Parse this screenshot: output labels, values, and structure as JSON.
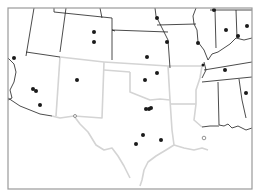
{
  "map": {
    "frame": {
      "x": 8,
      "y": 8,
      "w": 244,
      "h": 181,
      "stroke": "#9a9a9a"
    },
    "colors": {
      "background": "#ffffff",
      "dark_border": "#1e1e1e",
      "light_border": "#d4d4d4",
      "marker": "#1a1a1a",
      "marker_hollow": "#7a7a7a"
    },
    "dark_borders": [
      {
        "name": "nevada-utah",
        "d": "M34,8 L26,56"
      },
      {
        "name": "utah-east",
        "d": "M66,8 L60,52"
      },
      {
        "name": "utah-arizona",
        "d": "M26,52 L60,57"
      },
      {
        "name": "wyoming-colorado",
        "d": "M54,12 L112,18"
      },
      {
        "name": "wyoming-north",
        "d": "M54,8 L54,12"
      },
      {
        "name": "nebraska-top",
        "d": "M100,8 L102,18"
      },
      {
        "name": "colorado-east",
        "d": "M112,18 L112,60"
      },
      {
        "name": "colorado-kansas",
        "d": "M112,30 L168,32"
      },
      {
        "name": "nebraska-kansas",
        "d": "M112,30 L115,31"
      },
      {
        "name": "kansas-missouri",
        "d": "M164,32 L168,40 L170,68"
      },
      {
        "name": "nebraska-iowa",
        "d": "M155,8 L156,16 L160,24 L164,32"
      },
      {
        "name": "iowa-missouri",
        "d": "M157,25 L196,24"
      },
      {
        "name": "iowa-illinois",
        "d": "M196,8 L193,16 L194,24 L197,30 L198,42 L204,50 L208,60"
      },
      {
        "name": "illinois-indiana",
        "d": "M215,10 L216,48"
      },
      {
        "name": "indiana-ohio",
        "d": "M236,10 L237,38"
      },
      {
        "name": "ohio-river",
        "d": "M208,60 L212,54 L218,52 L224,48 L230,44 L236,38 L244,40 L252,38"
      },
      {
        "name": "illinois-top",
        "d": "M210,10 L252,10"
      },
      {
        "name": "kentucky-tennessee",
        "d": "M204,70 L252,62"
      },
      {
        "name": "missouri-tennessee",
        "d": "M204,62 L206,70 L202,78"
      },
      {
        "name": "tennessee-south",
        "d": "M202,82 L252,77"
      },
      {
        "name": "mississippi-alabama",
        "d": "M218,82 L219,125"
      },
      {
        "name": "alabama-georgia",
        "d": "M239,79 L242,100 L246,118"
      },
      {
        "name": "gulf-coast-east",
        "d": "M219,125 L224,126 L228,124 L232,128 L238,126 L246,130 L252,128"
      },
      {
        "name": "ms-coast",
        "d": "M202,127 L210,126 L219,126"
      },
      {
        "name": "california-nevada",
        "d": "M8,58 L14,64 L16,72"
      },
      {
        "name": "california-arizona",
        "d": "M16,72 L14,82 L10,90 L12,98 L8,100"
      },
      {
        "name": "arizona-mexico",
        "d": "M8,98 L20,106 L40,114 L52,116"
      }
    ],
    "light_borders": [
      {
        "name": "arizona-newmexico",
        "d": "M60,57 L56,116"
      },
      {
        "name": "colorado-newmexico",
        "d": "M60,57 L104,62"
      },
      {
        "name": "newmexico-oklahoma-panhandle",
        "d": "M104,62 L168,66"
      },
      {
        "name": "newmexico-texas",
        "d": "M104,62 L102,118 L74,116"
      },
      {
        "name": "newmexico-mexico",
        "d": "M52,116 L60,118 L74,116"
      },
      {
        "name": "oklahoma-panhandle-south",
        "d": "M104,70 L130,72"
      },
      {
        "name": "oklahoma-texas",
        "d": "M130,72 L130,92 L140,96 L150,100 L160,99 L170,100"
      },
      {
        "name": "oklahoma-arkansas",
        "d": "M168,66 L170,100"
      },
      {
        "name": "arkansas-north",
        "d": "M168,66 L202,66"
      },
      {
        "name": "arkansas-east",
        "d": "M202,66 L200,78 L196,90 L196,104"
      },
      {
        "name": "arkansas-south",
        "d": "M170,104 L196,104"
      },
      {
        "name": "texas-louisiana",
        "d": "M170,100 L172,130 L174,145"
      },
      {
        "name": "louisiana-mississippi",
        "d": "M196,104 L194,120 L202,127"
      },
      {
        "name": "louisiana-coast",
        "d": "M174,145 L184,148 L194,150 L202,148 L208,150"
      },
      {
        "name": "rio-grande",
        "d": "M74,116 L80,124 L88,132 L96,145 L104,150 L112,148 L118,156 L124,166 L130,178"
      },
      {
        "name": "texas-coast",
        "d": "M174,145 L166,150 L156,156 L148,162 L144,170 L142,180 L140,186"
      }
    ],
    "markers": [
      {
        "name": "marker-nevada",
        "cx": 14,
        "cy": 58,
        "r": 2
      },
      {
        "name": "marker-phoenix-1",
        "cx": 33,
        "cy": 89,
        "r": 2
      },
      {
        "name": "marker-phoenix-2",
        "cx": 36,
        "cy": 91,
        "r": 2
      },
      {
        "name": "marker-tucson",
        "cx": 40,
        "cy": 105,
        "r": 2
      },
      {
        "name": "marker-colorado-1",
        "cx": 94,
        "cy": 32,
        "r": 2
      },
      {
        "name": "marker-colorado-2",
        "cx": 94,
        "cy": 42,
        "r": 2
      },
      {
        "name": "marker-newmexico",
        "cx": 77,
        "cy": 80,
        "r": 2
      },
      {
        "name": "marker-nebraska",
        "cx": 157,
        "cy": 18,
        "r": 2
      },
      {
        "name": "marker-kansas-city",
        "cx": 167,
        "cy": 42,
        "r": 2
      },
      {
        "name": "marker-kansas",
        "cx": 147,
        "cy": 57,
        "r": 2
      },
      {
        "name": "marker-tulsa",
        "cx": 157,
        "cy": 73,
        "r": 2
      },
      {
        "name": "marker-okc",
        "cx": 145,
        "cy": 80,
        "r": 2
      },
      {
        "name": "marker-dallas-1",
        "cx": 146,
        "cy": 109,
        "r": 2
      },
      {
        "name": "marker-dallas-2",
        "cx": 149,
        "cy": 109,
        "r": 2
      },
      {
        "name": "marker-dallas-3",
        "cx": 151,
        "cy": 108,
        "r": 2
      },
      {
        "name": "marker-austin",
        "cx": 143,
        "cy": 135,
        "r": 2
      },
      {
        "name": "marker-san-antonio",
        "cx": 136,
        "cy": 144,
        "r": 2
      },
      {
        "name": "marker-houston",
        "cx": 161,
        "cy": 140,
        "r": 2
      },
      {
        "name": "marker-stlouis",
        "cx": 198,
        "cy": 43,
        "r": 2
      },
      {
        "name": "marker-chicago",
        "cx": 214,
        "cy": 10,
        "r": 2
      },
      {
        "name": "marker-indianapolis",
        "cx": 226,
        "cy": 30,
        "r": 2
      },
      {
        "name": "marker-ohio",
        "cx": 247,
        "cy": 26,
        "r": 2
      },
      {
        "name": "marker-louisville",
        "cx": 238,
        "cy": 36,
        "r": 2
      },
      {
        "name": "marker-nashville",
        "cx": 225,
        "cy": 70,
        "r": 2
      },
      {
        "name": "marker-memphis",
        "cx": 203,
        "cy": 65,
        "r": 1.5
      },
      {
        "name": "marker-birmingham",
        "cx": 246,
        "cy": 93,
        "r": 2
      }
    ],
    "hollow_markers": [
      {
        "name": "marker-el-paso",
        "cx": 75,
        "cy": 116,
        "r": 1.5
      },
      {
        "name": "marker-new-orleans",
        "cx": 204,
        "cy": 138,
        "r": 1.8
      }
    ]
  }
}
